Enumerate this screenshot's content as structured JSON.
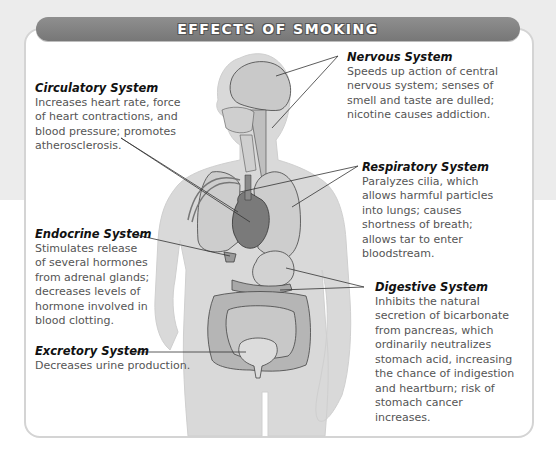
{
  "title": "EFFECTS OF SMOKING",
  "systems": {
    "circulatory": {
      "heading": "Circulatory System",
      "lines": [
        "Increases heart rate, force",
        "of heart contractions, and",
        "blood pressure;  promotes",
        "atherosclerosis."
      ]
    },
    "nervous": {
      "heading": "Nervous System",
      "lines": [
        "Speeds up action of central",
        "nervous system;  senses of",
        "smell and taste are dulled;",
        "nicotine causes addiction."
      ]
    },
    "respiratory": {
      "heading": "Respiratory System",
      "lines": [
        "Paralyzes cilia, which",
        "allows harmful particles",
        "into lungs;  causes",
        "shortness of breath;",
        "allows tar to enter",
        "bloodstream."
      ]
    },
    "endocrine": {
      "heading": "Endocrine System",
      "lines": [
        "Stimulates release",
        "of several hormones",
        "from adrenal glands;",
        "decreases levels of",
        "hormone involved in",
        "blood clotting."
      ]
    },
    "digestive": {
      "heading": "Digestive System",
      "lines": [
        "Inhibits the natural",
        "secretion of bicarbonate",
        "from pancreas, which",
        "ordinarily neutralizes",
        "stomach acid, increasing",
        "the chance of indigestion",
        "and heartburn;  risk of",
        "stomach cancer",
        "increases."
      ]
    },
    "excretory": {
      "heading": "Excretory System",
      "lines": [
        "Decreases urine production."
      ]
    }
  },
  "colors": {
    "title_bar": "#808080",
    "body_silhouette": "#d6d6d6",
    "organ_fill": "#c4c4c4",
    "heart_fill": "#7a7a7a",
    "text": "#555555",
    "heading": "#111111"
  }
}
